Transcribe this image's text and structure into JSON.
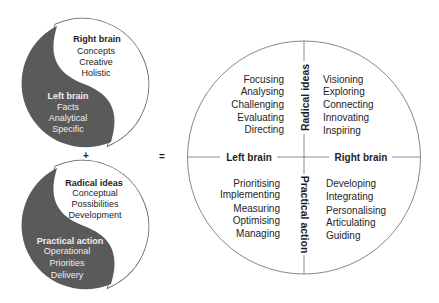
{
  "equation": {
    "plus": "+",
    "equals": "="
  },
  "yin_yang_top": {
    "light": {
      "title": "Right brain",
      "items": [
        "Concepts",
        "Creative",
        "Holistic"
      ]
    },
    "dark": {
      "title": "Left brain",
      "items": [
        "Facts",
        "Analytical",
        "Specific"
      ]
    }
  },
  "yin_yang_bottom": {
    "light": {
      "title": "Radical ideas",
      "items": [
        "Conceptual",
        "Possibilities",
        "Development"
      ]
    },
    "dark": {
      "title": "Practical action",
      "items": [
        "Operational",
        "Priorities",
        "Delivery"
      ]
    }
  },
  "matrix": {
    "axes": {
      "left": "Left brain",
      "right": "Right brain",
      "top": "Radical ideas",
      "bottom": "Practical action"
    },
    "quadrants": {
      "top_left": [
        "Focusing",
        "Analysing",
        "Challenging",
        "Evaluating",
        "Directing"
      ],
      "top_right": [
        "Visioning",
        "Exploring",
        "Connecting",
        "Innovating",
        "Inspiring"
      ],
      "bottom_left": [
        "Prioritising",
        "Implementing",
        "Measuring",
        "Optimising",
        "Managing"
      ],
      "bottom_right": [
        "Developing",
        "Integrating",
        "Personalising",
        "Articulating",
        "Guiding"
      ]
    }
  },
  "colors": {
    "dark_fill": "#5a5a5a",
    "outline": "#555555",
    "grid_line": "#6e6e6e",
    "text": "#1e1e1e",
    "text_on_dark": "#eeeeee"
  }
}
